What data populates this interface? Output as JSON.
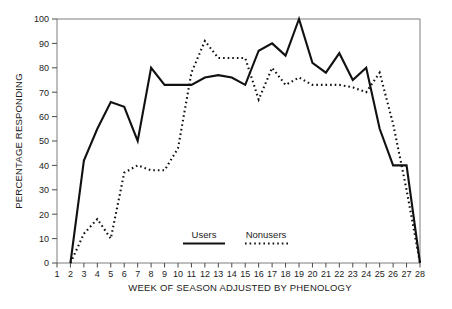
{
  "chart_data": {
    "type": "line",
    "title": "",
    "xlabel": "WEEK OF SEASON ADJUSTED BY PHENOLOGY",
    "ylabel": "PERCENTAGE RESPONDING",
    "xlim": [
      1,
      28
    ],
    "ylim": [
      0,
      100
    ],
    "grid": false,
    "legend_position": "inside-bottom-center",
    "x": [
      1,
      2,
      3,
      4,
      5,
      6,
      7,
      8,
      9,
      10,
      11,
      12,
      13,
      14,
      15,
      16,
      17,
      18,
      19,
      20,
      21,
      22,
      23,
      24,
      25,
      26,
      27,
      28
    ],
    "xticks": [
      "1",
      "2",
      "3",
      "4",
      "5",
      "6",
      "7",
      "8",
      "9",
      "10",
      "11",
      "12",
      "13",
      "14",
      "15",
      "16",
      "17",
      "18",
      "19",
      "20",
      "21",
      "22",
      "23",
      "24",
      "25",
      "26",
      "27",
      "28"
    ],
    "yticks": [
      "0",
      "10",
      "20",
      "30",
      "40",
      "50",
      "60",
      "70",
      "80",
      "90",
      "100"
    ],
    "series": [
      {
        "name": "Users",
        "style": "solid",
        "color": "#111111",
        "x": [
          2,
          3,
          4,
          5,
          6,
          7,
          8,
          9,
          10,
          11,
          12,
          13,
          14,
          15,
          16,
          17,
          18,
          19,
          20,
          21,
          22,
          23,
          24,
          25,
          26,
          27,
          28
        ],
        "values": [
          0,
          42,
          55,
          66,
          64,
          50,
          80,
          73,
          73,
          73,
          76,
          77,
          76,
          73,
          87,
          90,
          85,
          100,
          82,
          78,
          86,
          75,
          80,
          55,
          40,
          40,
          0
        ]
      },
      {
        "name": "Nonusers",
        "style": "dotted",
        "color": "#111111",
        "x": [
          2,
          3,
          4,
          5,
          6,
          7,
          8,
          9,
          10,
          11,
          12,
          13,
          14,
          15,
          16,
          17,
          18,
          19,
          20,
          21,
          22,
          23,
          24,
          25,
          26,
          27,
          28
        ],
        "values": [
          0,
          12,
          18,
          10,
          37,
          40,
          38,
          38,
          47,
          78,
          91,
          84,
          84,
          84,
          67,
          80,
          73,
          76,
          73,
          73,
          73,
          72,
          70,
          78,
          57,
          30,
          0
        ]
      }
    ]
  },
  "legend": {
    "users_label": "Users",
    "nonusers_label": "Nonusers"
  },
  "axes": {
    "y_title": "PERCENTAGE RESPONDING",
    "x_title": "WEEK OF SEASON ADJUSTED BY PHENOLOGY"
  }
}
